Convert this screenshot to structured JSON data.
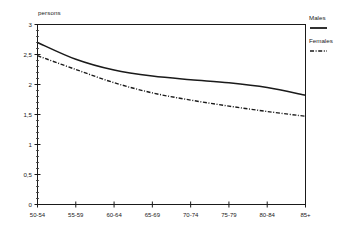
{
  "chart_data": {
    "type": "line",
    "title": "",
    "subtitle": "",
    "xlabel": "",
    "ylabel": "persons",
    "categories": [
      "50-54",
      "55-59",
      "60-64",
      "65-69",
      "70-74",
      "75-79",
      "80-84",
      "85+"
    ],
    "series": [
      {
        "name": "Males",
        "style": "solid",
        "color": "#1a1a1a",
        "values": [
          2.7,
          2.42,
          2.24,
          2.14,
          2.08,
          2.03,
          1.95,
          1.82
        ]
      },
      {
        "name": "Females",
        "style": "dash-dot",
        "color": "#1a1a1a",
        "values": [
          2.48,
          2.25,
          2.03,
          1.86,
          1.74,
          1.64,
          1.55,
          1.47
        ]
      }
    ],
    "ylim": [
      0,
      3
    ],
    "ytick_values": [
      0,
      0.5,
      1,
      1.5,
      2,
      2.5,
      3
    ],
    "ytick_labels": [
      "0",
      "0,5",
      "1",
      "1,5",
      "2",
      "2,5",
      "3"
    ],
    "y_minor_tick_step": 0.1,
    "grid": false,
    "legend_position": "right-top",
    "annotations": []
  },
  "axes": {
    "y_axis_title": "persons"
  },
  "legend": {
    "entries": [
      {
        "label": "Males",
        "swatch": "solid-line-swatch"
      },
      {
        "label": "Females",
        "swatch": "dash-dot-line-swatch"
      }
    ]
  }
}
